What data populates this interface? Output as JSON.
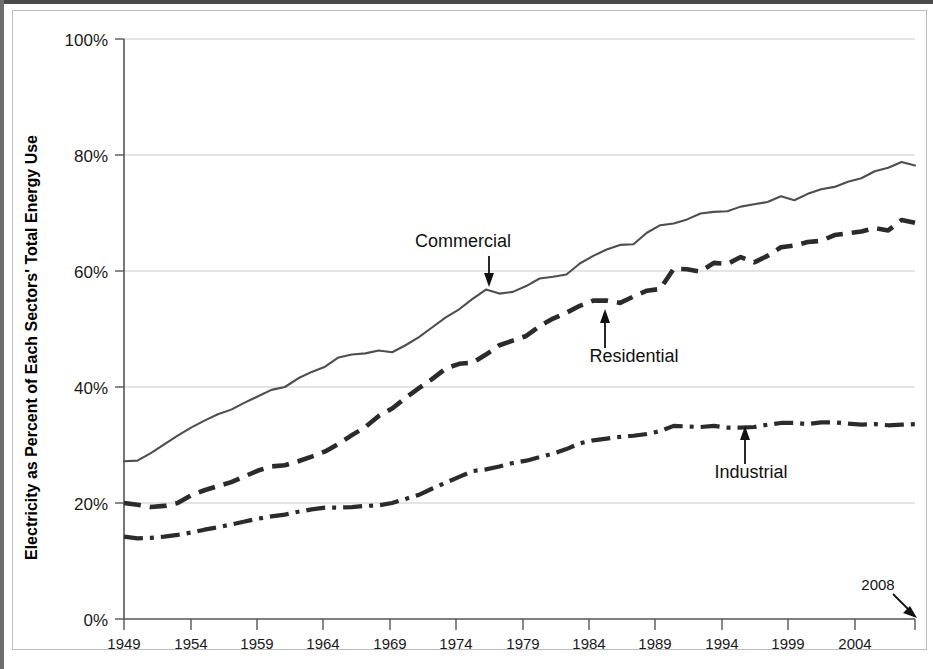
{
  "chart_data": {
    "type": "line",
    "title": "",
    "xlabel": "",
    "ylabel": "Electricity as Percent of Each Sectors' Total Energy Use",
    "xlim": [
      1949,
      2008
    ],
    "ylim": [
      0,
      100
    ],
    "y_tick_labels": [
      "0%",
      "20%",
      "40%",
      "60%",
      "80%",
      "100%"
    ],
    "y_tick_values": [
      0,
      20,
      40,
      60,
      80,
      100
    ],
    "x_tick_labels": [
      "1949",
      "1954",
      "1959",
      "1964",
      "1969",
      "1974",
      "1979",
      "1984",
      "1989",
      "1994",
      "1999",
      "2004"
    ],
    "x_tick_values": [
      1949,
      1954,
      1959,
      1964,
      1969,
      1974,
      1979,
      1984,
      1989,
      1994,
      1999,
      2004
    ],
    "grid": "horizontal",
    "legend": "inline-annotations",
    "x": [
      1949,
      1950,
      1951,
      1952,
      1953,
      1954,
      1955,
      1956,
      1957,
      1958,
      1959,
      1960,
      1961,
      1962,
      1963,
      1964,
      1965,
      1966,
      1967,
      1968,
      1969,
      1970,
      1971,
      1972,
      1973,
      1974,
      1975,
      1976,
      1977,
      1978,
      1979,
      1980,
      1981,
      1982,
      1983,
      1984,
      1985,
      1986,
      1987,
      1988,
      1989,
      1990,
      1991,
      1992,
      1993,
      1994,
      1995,
      1996,
      1997,
      1998,
      1999,
      2000,
      2001,
      2002,
      2003,
      2004,
      2005,
      2006,
      2007,
      2008
    ],
    "series": [
      {
        "name": "Commercial",
        "style": "solid-thin",
        "color": "#4e4e4e",
        "values": [
          27.2,
          27.3,
          28.6,
          30.1,
          31.6,
          33.0,
          34.2,
          35.3,
          36.1,
          37.3,
          38.4,
          39.5,
          40.0,
          41.5,
          42.6,
          43.5,
          45.1,
          45.6,
          45.8,
          46.3,
          46.0,
          47.2,
          48.6,
          50.3,
          52.0,
          53.4,
          55.2,
          56.8,
          56.1,
          56.4,
          57.4,
          58.7,
          59.0,
          59.4,
          61.3,
          62.6,
          63.7,
          64.5,
          64.6,
          66.6,
          67.9,
          68.2,
          68.9,
          69.9,
          70.2,
          70.3,
          71.1,
          71.5,
          71.9,
          72.9,
          72.2,
          73.3,
          74.1,
          74.5,
          75.4,
          76.0,
          77.2,
          77.8,
          78.8,
          78.2
        ]
      },
      {
        "name": "Residential",
        "style": "dashed-thick",
        "color": "#2b2b2b",
        "values": [
          20.0,
          19.7,
          19.3,
          19.5,
          20.0,
          21.3,
          22.2,
          22.9,
          23.6,
          24.6,
          25.6,
          26.3,
          26.5,
          27.2,
          28.0,
          28.9,
          30.2,
          31.7,
          33.1,
          35.0,
          36.3,
          38.1,
          39.8,
          41.4,
          43.2,
          44.0,
          44.2,
          45.6,
          47.2,
          48.0,
          48.8,
          50.5,
          51.8,
          52.8,
          54.0,
          54.9,
          54.9,
          54.5,
          55.6,
          56.6,
          56.9,
          60.4,
          60.3,
          59.9,
          61.4,
          61.2,
          62.4,
          61.5,
          62.6,
          64.1,
          64.4,
          65.0,
          65.2,
          66.2,
          66.5,
          66.8,
          67.4,
          67.0,
          68.8,
          68.3
        ]
      },
      {
        "name": "Industrial",
        "style": "dash-dot-thick",
        "color": "#2b2b2b",
        "values": [
          14.2,
          13.9,
          14.0,
          14.2,
          14.5,
          14.9,
          15.4,
          15.8,
          16.3,
          16.8,
          17.3,
          17.7,
          18.0,
          18.5,
          18.9,
          19.2,
          19.2,
          19.3,
          19.5,
          19.6,
          20.0,
          20.7,
          21.4,
          22.5,
          23.5,
          24.5,
          25.5,
          25.8,
          26.3,
          26.9,
          27.3,
          27.9,
          28.5,
          29.3,
          30.3,
          30.8,
          31.1,
          31.4,
          31.6,
          31.9,
          32.4,
          33.3,
          33.2,
          33.1,
          33.3,
          33.0,
          33.0,
          33.1,
          33.5,
          33.8,
          33.8,
          33.6,
          33.9,
          33.9,
          33.7,
          33.5,
          33.6,
          33.4,
          33.5,
          33.6
        ]
      }
    ],
    "annotations": [
      {
        "name": "commercial-label",
        "text": "Commercial",
        "arrow": "down",
        "target_year": 1975,
        "target_value": 57
      },
      {
        "name": "residential-label",
        "text": "Residential",
        "arrow": "up",
        "target_year": 1984,
        "target_value": 55
      },
      {
        "name": "industrial-label",
        "text": "Industrial",
        "arrow": "up",
        "target_year": 1995,
        "target_value": 33
      },
      {
        "name": "end-year-label",
        "text": "2008",
        "arrow": "down-right",
        "target_year": 2008,
        "target_value": 0
      }
    ]
  },
  "axis": {
    "y_title": "Electricity as Percent of Each Sectors' Total Energy Use",
    "ticks_y": [
      {
        "label": "100%",
        "value": 100
      },
      {
        "label": "80%",
        "value": 80
      },
      {
        "label": "60%",
        "value": 60
      },
      {
        "label": "40%",
        "value": 40
      },
      {
        "label": "20%",
        "value": 20
      },
      {
        "label": "0%",
        "value": 0
      }
    ],
    "ticks_x": [
      {
        "label": "1949"
      },
      {
        "label": "1954"
      },
      {
        "label": "1959"
      },
      {
        "label": "1964"
      },
      {
        "label": "1969"
      },
      {
        "label": "1974"
      },
      {
        "label": "1979"
      },
      {
        "label": "1984"
      },
      {
        "label": "1989"
      },
      {
        "label": "1994"
      },
      {
        "label": "1999"
      },
      {
        "label": "2004"
      }
    ]
  },
  "annotations": {
    "commercial": "Commercial",
    "residential": "Residential",
    "industrial": "Industrial",
    "end_year": "2008"
  }
}
